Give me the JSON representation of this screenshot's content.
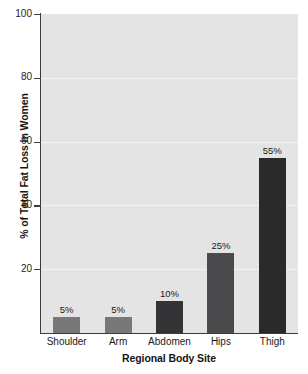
{
  "chart_data": {
    "type": "bar",
    "title": "",
    "subtitle": "",
    "categories": [
      "Shoulder",
      "Arm",
      "Abdomen",
      "Hips",
      "Thigh"
    ],
    "values": [
      5,
      10,
      25,
      55,
      5
    ],
    "series": [
      {
        "name": "% of Total Fat Loss in Women",
        "values": [
          5,
          5,
          10,
          25,
          55
        ]
      }
    ],
    "data_labels": [
      "5%",
      "5%",
      "10%",
      "25%",
      "55%"
    ],
    "bar_colors": [
      "#78787a",
      "#78787a",
      "#333335",
      "#4a4a4c",
      "#2a2a2c"
    ],
    "xlabel": "Regional Body Site",
    "ylabel": "% of Total Fat Loss in Women",
    "ylim": [
      0,
      100
    ],
    "ytick_labels": [
      "100",
      "80",
      "60",
      "40",
      "20"
    ],
    "ytick_values": [
      100,
      80,
      60,
      40,
      20
    ],
    "xtick_labels": [
      "Shoulder",
      "Arm",
      "Abdomen",
      "Hips",
      "Thigh"
    ],
    "grid": true,
    "grid_color": "#f4f4f4",
    "plot_background": "#e4e4e4",
    "page_background": "#ffffff",
    "axis_color": "#3c3c3c",
    "legend": [],
    "legend_position": "none",
    "annotations": []
  }
}
